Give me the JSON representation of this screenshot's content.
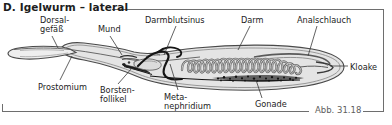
{
  "figure": {
    "title": "D. Igelwurm – lateral",
    "number": "Abb. 31.18",
    "colors": {
      "frame": "#6e6e6e",
      "text": "#1d1d1d",
      "caption_text": "#5d5d5d",
      "leader_line": "#3a3a3a",
      "body_fill": "#e8e8e8",
      "body_outline": "#4a4a4a",
      "gut_stroke": "#5a5a5a",
      "gut_fill": "#d8d8d8",
      "vessel_dark": "#1a1a1a",
      "gonade_fill": "#3d3d3d",
      "background": "#ffffff"
    }
  },
  "labels": [
    {
      "id": "dorsalgefaess",
      "text": "Dorsal-\ngefäß",
      "x": 40,
      "y": 16
    },
    {
      "id": "mund",
      "text": "Mund",
      "x": 98,
      "y": 25
    },
    {
      "id": "darmblutsinus",
      "text": "Darmblutsinus",
      "x": 145,
      "y": 16
    },
    {
      "id": "darm",
      "text": "Darm",
      "x": 241,
      "y": 16
    },
    {
      "id": "analschlauch",
      "text": "Analschlauch",
      "x": 297,
      "y": 16
    },
    {
      "id": "kloake",
      "text": "Kloake",
      "x": 350,
      "y": 63
    },
    {
      "id": "prostomium",
      "text": "Prostomium",
      "x": 38,
      "y": 83
    },
    {
      "id": "borstenfollikel",
      "text": "Borsten-\nfollikel",
      "x": 100,
      "y": 86
    },
    {
      "id": "metanephridium",
      "text": "Meta-\nnephridium",
      "x": 164,
      "y": 93
    },
    {
      "id": "gonade",
      "text": "Gonade",
      "x": 255,
      "y": 100
    }
  ],
  "leader_lines": [
    {
      "id": "leader-dorsalgefaess",
      "points": "52,36 58,48"
    },
    {
      "id": "leader-mund",
      "points": "110,36 122,55"
    },
    {
      "id": "leader-darmblutsinus",
      "points": "176,26 164,55"
    },
    {
      "id": "leader-darm",
      "points": "250,26 238,50"
    },
    {
      "id": "leader-analschlauch",
      "points": "317,26 308,56"
    },
    {
      "id": "leader-kloake",
      "points": "348,66 330,66"
    },
    {
      "id": "leader-prostomium",
      "points": "60,80 72,56"
    },
    {
      "id": "leader-borstenfollikel",
      "points": "118,84 132,68"
    },
    {
      "id": "leader-metanephridium",
      "points": "178,90 170,64"
    },
    {
      "id": "leader-gonade",
      "points": "262,98 256,80"
    }
  ]
}
